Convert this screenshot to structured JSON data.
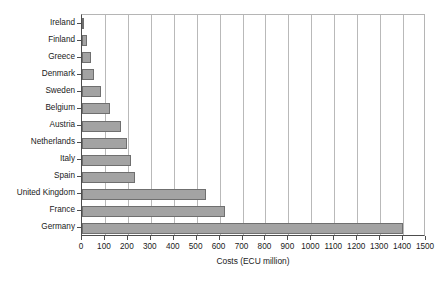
{
  "chart_data": {
    "type": "bar",
    "orientation": "horizontal",
    "title": "",
    "xlabel": "Costs (ECU million)",
    "ylabel": "",
    "xlim": [
      0,
      1500
    ],
    "xtick_step": 100,
    "grid": true,
    "legend": false,
    "bar_color": "#a3a3a3",
    "bar_border_color": "#6f6f6f",
    "axis_color": "#4d4d4d",
    "gridline_color": "#b9b9b9",
    "categories": [
      "Ireland",
      "Finland",
      "Greece",
      "Denmark",
      "Sweden",
      "Belgium",
      "Austria",
      "Netherlands",
      "Italy",
      "Spain",
      "United Kingdom",
      "France",
      "Germany"
    ],
    "values": [
      10,
      22,
      40,
      52,
      83,
      122,
      170,
      196,
      214,
      231,
      541,
      624,
      1400
    ],
    "xticks": [
      "0",
      "100",
      "200",
      "300",
      "400",
      "500",
      "600",
      "700",
      "800",
      "900",
      "1000",
      "1100",
      "1200",
      "1300",
      "1400",
      "1500"
    ]
  }
}
